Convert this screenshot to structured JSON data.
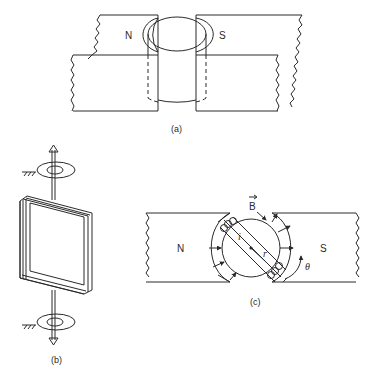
{
  "figure": {
    "panel_a": {
      "caption": "(a)",
      "north_label": "N",
      "south_label": "S"
    },
    "panel_b": {
      "caption": "(b)"
    },
    "panel_c": {
      "caption": "(c)",
      "north_label": "N",
      "south_label": "S",
      "field_label": "B",
      "current_label": "i",
      "radius_label": "r",
      "angle_label": "θ"
    }
  }
}
